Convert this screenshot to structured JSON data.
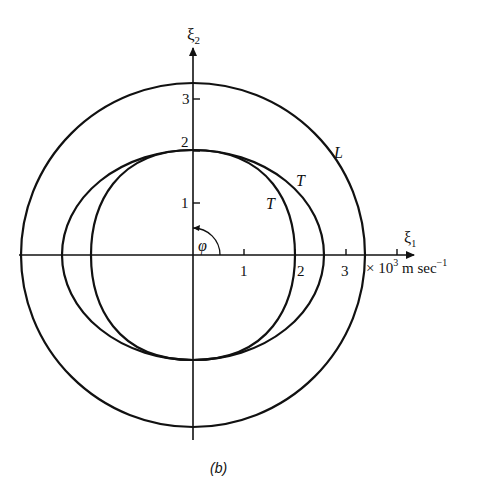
{
  "diagram": {
    "caption": "(b)",
    "axes": {
      "x_label": "ξ",
      "x_sub": "1",
      "y_label": "ξ",
      "y_sub": "2",
      "unit_prefix": "× 10",
      "unit_exp": "3",
      "unit_mid": " m sec",
      "unit_exp2": "−1",
      "x_ticks": [
        "1",
        "2",
        "3"
      ],
      "y_ticks": [
        "1",
        "2",
        "3"
      ]
    },
    "angle_label": "φ",
    "curves": [
      {
        "label": "L",
        "description": "outer circle",
        "radius": 3.35
      },
      {
        "label": "T",
        "description": "outer transverse oval",
        "semi_x": 2.55,
        "semi_y": 2.05
      },
      {
        "label": "T",
        "description": "inner transverse oval",
        "semi_x": 2.0,
        "semi_y": 2.05
      }
    ],
    "colors": {
      "ink": "#111111",
      "background": "#ffffff"
    }
  }
}
